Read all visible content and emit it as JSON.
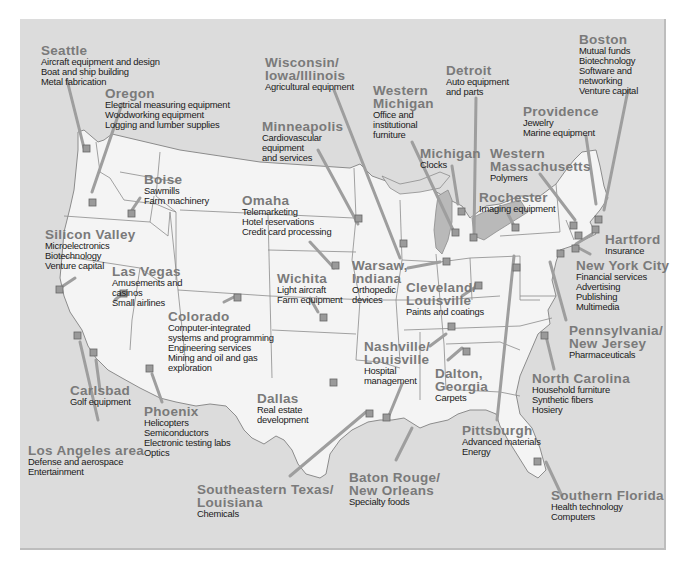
{
  "map": {
    "title": "",
    "type": "US map of regional industry clusters",
    "colors": {
      "background": "#dcdcdc",
      "land": "#f4f4f4",
      "borders": "#8c8c8c",
      "marker": "#9a9a9a",
      "leader_line": "#9e9e9e",
      "label_title": "#7a7a7a",
      "label_text": "#1a1a1a"
    },
    "regions": [
      {
        "name": "Seattle",
        "industries": [
          "Aircraft equipment and design",
          "Boat and ship building",
          "Metal fabrication"
        ]
      },
      {
        "name": "Oregon",
        "industries": [
          "Electrical measuring equipment",
          "Woodworking equipment",
          "Logging and lumber supplies"
        ]
      },
      {
        "name": "Boise",
        "industries": [
          "Sawmills",
          "Farm machinery"
        ]
      },
      {
        "name": "Silicon Valley",
        "industries": [
          "Microelectronics",
          "Biotechnology",
          "Venture capital"
        ]
      },
      {
        "name": "Las Vegas",
        "industries": [
          "Amusements and",
          "casinos",
          "Small airlines"
        ]
      },
      {
        "name": "Colorado",
        "industries": [
          "Computer-integrated",
          "systems and programming",
          "Engineering services",
          "Mining and oil and gas",
          "exploration"
        ]
      },
      {
        "name": "Carlsbad",
        "industries": [
          "Golf equipment"
        ]
      },
      {
        "name": "Phoenix",
        "industries": [
          "Helicopters",
          "Semiconductors",
          "Electronic testing labs",
          "Optics"
        ]
      },
      {
        "name": "Los Angeles area",
        "industries": [
          "Defense and aerospace",
          "Entertainment"
        ]
      },
      {
        "name": "Wisconsin/ Iowa/Illinois",
        "title_lines": [
          "Wisconsin/",
          "Iowa/Illinois"
        ],
        "industries": [
          "Agricultural equipment"
        ]
      },
      {
        "name": "Minneapolis",
        "industries": [
          "Cardiovascular",
          "equipment",
          "and services"
        ]
      },
      {
        "name": "Omaha",
        "industries": [
          "Telemarketing",
          "Hotel reservations",
          "Credit card processing"
        ]
      },
      {
        "name": "Wichita",
        "industries": [
          "Light aircraft",
          "Farm equipment"
        ]
      },
      {
        "name": "Dallas",
        "industries": [
          "Real estate",
          "development"
        ]
      },
      {
        "name": "Southeastern Texas/ Louisiana",
        "title_lines": [
          "Southeastern Texas/",
          "Louisiana"
        ],
        "industries": [
          "Chemicals"
        ]
      },
      {
        "name": "Baton Rouge/ New Orleans",
        "title_lines": [
          "Baton Rouge/",
          "New Orleans"
        ],
        "industries": [
          "Specialty foods"
        ]
      },
      {
        "name": "Western Michigan",
        "title_lines": [
          "Western",
          "Michigan"
        ],
        "industries": [
          "Office and",
          "institutional",
          "furniture"
        ]
      },
      {
        "name": "Michigan",
        "industries": [
          "Clocks"
        ]
      },
      {
        "name": "Detroit",
        "industries": [
          "Auto equipment",
          "and parts"
        ]
      },
      {
        "name": "Warsaw, Indiana",
        "title_lines": [
          "Warsaw,",
          "Indiana"
        ],
        "industries": [
          "Orthopedic",
          "devices"
        ]
      },
      {
        "name": "Cleveland/ Louisville",
        "title_lines": [
          "Cleveland/",
          "Louisville"
        ],
        "industries": [
          "Paints and coatings"
        ]
      },
      {
        "name": "Nashville/ Louisville",
        "title_lines": [
          "Nashville/",
          "Louisville"
        ],
        "industries": [
          "Hospital",
          "management"
        ]
      },
      {
        "name": "Dalton, Georgia",
        "title_lines": [
          "Dalton,",
          "Georgia"
        ],
        "industries": [
          "Carpets"
        ]
      },
      {
        "name": "Pittsburgh",
        "industries": [
          "Advanced materials",
          "Energy"
        ]
      },
      {
        "name": "Boston",
        "industries": [
          "Mutual funds",
          "Biotechnology",
          "Software and",
          "networking",
          "Venture capital"
        ]
      },
      {
        "name": "Providence",
        "industries": [
          "Jewelry",
          "Marine equipment"
        ]
      },
      {
        "name": "Western Massachusetts",
        "title_lines": [
          "Western",
          "Massachusetts"
        ],
        "industries": [
          "Polymers"
        ]
      },
      {
        "name": "Rochester",
        "industries": [
          "Imaging equipment"
        ]
      },
      {
        "name": "Hartford",
        "industries": [
          "Insurance"
        ]
      },
      {
        "name": "New York City",
        "industries": [
          "Financial services",
          "Advertising",
          "Publishing",
          "Multimedia"
        ]
      },
      {
        "name": "Pennsylvania/ New Jersey",
        "title_lines": [
          "Pennsylvania/",
          "New Jersey"
        ],
        "industries": [
          "Pharmaceuticals"
        ]
      },
      {
        "name": "North Carolina",
        "industries": [
          "Household furniture",
          "Synthetic fibers",
          "Hosiery"
        ]
      },
      {
        "name": "Southern Florida",
        "industries": [
          "Health technology",
          "Computers"
        ]
      }
    ]
  }
}
